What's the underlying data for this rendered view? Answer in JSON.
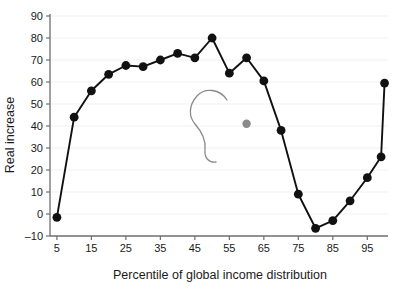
{
  "chart_data": {
    "type": "line",
    "title": "",
    "subtitle": "",
    "xlabel": "Percentile of global income distribution",
    "ylabel": "Real increase",
    "xlim": [
      3,
      101
    ],
    "ylim": [
      -10,
      90
    ],
    "xticks": [
      5,
      15,
      25,
      35,
      45,
      55,
      65,
      75,
      85,
      95
    ],
    "yticks": [
      -10,
      0,
      10,
      20,
      30,
      40,
      50,
      60,
      70,
      80,
      90
    ],
    "grid": true,
    "grid_axis": "y",
    "legend": "none",
    "series": [
      {
        "name": "Real increase",
        "marker": "filled-circle",
        "color": "#111111",
        "x": [
          5,
          10,
          15,
          20,
          25,
          30,
          35,
          40,
          45,
          50,
          55,
          60,
          65,
          70,
          75,
          80,
          85,
          90,
          95,
          99,
          100
        ],
        "values": [
          -1.5,
          44,
          56,
          63.5,
          67.5,
          67,
          70,
          73,
          71,
          80,
          64,
          71,
          60.5,
          38,
          9,
          -6.5,
          -3,
          6,
          16.5,
          26,
          59.5
        ]
      }
    ],
    "annotations": [
      {
        "name": "grey-dot-marker",
        "type": "point",
        "x": 60,
        "y": 41,
        "color": "#8a8a8a"
      },
      {
        "name": "grey-arc-marker",
        "type": "curve",
        "color": "#8a8a8a"
      }
    ]
  },
  "axes": {
    "x_tick_labels": [
      "5",
      "15",
      "25",
      "35",
      "45",
      "55",
      "65",
      "75",
      "85",
      "95"
    ],
    "y_tick_labels": [
      "–10",
      "0",
      "10",
      "20",
      "30",
      "40",
      "50",
      "60",
      "70",
      "80",
      "90"
    ],
    "x_axis_title": "Percentile of global income distribution",
    "y_axis_title": "Real increase"
  },
  "colors": {
    "line": "#111111",
    "marker": "#111111",
    "grid": "#eef1f4",
    "axis": "#6e6e6e",
    "text": "#1a1a1a",
    "annotation": "#8a8a8a",
    "background": "#ffffff"
  }
}
